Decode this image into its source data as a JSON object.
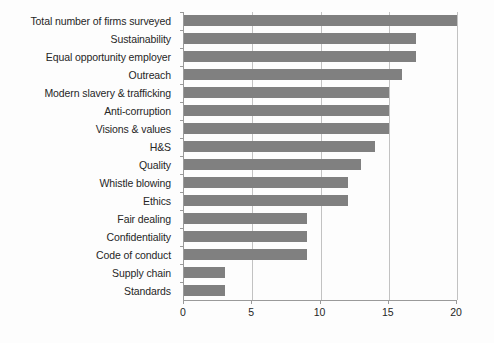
{
  "chart_data": {
    "type": "bar",
    "orientation": "horizontal",
    "title": "",
    "xlabel": "",
    "ylabel": "",
    "xlim": [
      0,
      20
    ],
    "xticks": [
      0,
      5,
      10,
      15,
      20
    ],
    "grid": true,
    "legend": false,
    "bar_color": "#808080",
    "categories": [
      "Total number of firms surveyed",
      "Sustainability",
      "Equal opportunity employer",
      "Outreach",
      "Modern slavery & trafficking",
      "Anti-corruption",
      "Visions & values",
      "H&S",
      "Quality",
      "Whistle blowing",
      "Ethics",
      "Fair dealing",
      "Confidentiality",
      "Code of conduct",
      "Supply chain",
      "Standards"
    ],
    "values": [
      20,
      17,
      17,
      16,
      15,
      15,
      15,
      14,
      13,
      12,
      12,
      9,
      9,
      9,
      3,
      3
    ]
  }
}
